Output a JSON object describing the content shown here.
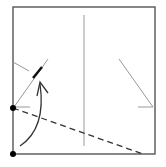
{
  "diagram": {
    "type": "origami-fold-step",
    "colors": {
      "paper_edge": "#555555",
      "crease": "#999999",
      "fold_line": "#333333",
      "arrow": "#333333",
      "point": "#000000",
      "background": "#ffffff"
    },
    "paper": {
      "x": 13,
      "y": 7,
      "width": 142,
      "height": 147
    },
    "center_crease": {
      "x1": 84,
      "y1": 15,
      "x2": 84,
      "y2": 146
    },
    "left_diagonal_crease": {
      "x1": 14,
      "y1": 107,
      "x2": 48,
      "y2": 59
    },
    "left_thick_mark": {
      "x1": 33,
      "y1": 78,
      "x2": 42,
      "y2": 67
    },
    "left_short_crease": {
      "x1": 13,
      "y1": 62,
      "x2": 29,
      "y2": 71
    },
    "left_tick": {
      "x1": 14,
      "y1": 107,
      "x2": 30,
      "y2": 107
    },
    "right_diagonal_crease": {
      "x1": 119,
      "y1": 59,
      "x2": 153,
      "y2": 107
    },
    "right_tick": {
      "x1": 138,
      "y1": 107,
      "x2": 153,
      "y2": 107
    },
    "valley_fold_line": {
      "x1": 13,
      "y1": 108,
      "x2": 143,
      "y2": 154
    },
    "arrow": {
      "path": "M20 146 C 38 134, 44 112, 40 84",
      "head_x": 40,
      "head_y": 82
    },
    "points": [
      {
        "name": "reference-point",
        "cx": 13,
        "cy": 108
      },
      {
        "name": "corner-point",
        "cx": 13,
        "cy": 154
      }
    ]
  }
}
